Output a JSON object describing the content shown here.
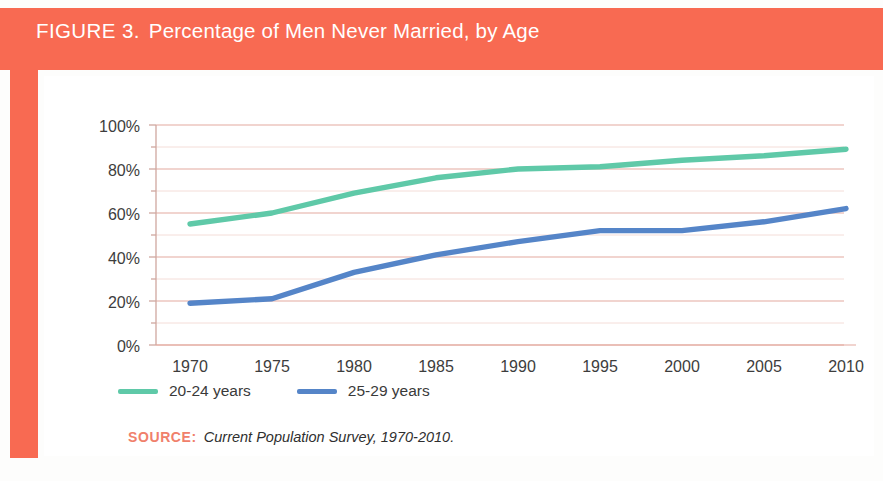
{
  "header": {
    "figure_label": "FIGURE 3.",
    "caption": "Percentage of Men Never Married, by Age",
    "band_color": "#f86a52"
  },
  "source": {
    "key": "SOURCE:",
    "text": "Current Population Survey, 1970-2010.",
    "key_color": "#f0806b"
  },
  "legend": {
    "position": "below-plot",
    "items": [
      {
        "label": "20-24 years",
        "color": "#5fc9a8"
      },
      {
        "label": "25-29 years",
        "color": "#5585c8"
      }
    ]
  },
  "axes": {
    "y_ticks": [
      "0%",
      "20%",
      "40%",
      "60%",
      "80%",
      "100%"
    ],
    "x_ticks": [
      "1970",
      "1975",
      "1980",
      "1985",
      "1990",
      "1995",
      "2000",
      "2005",
      "2010"
    ],
    "gridline_color": "#e9b7ae",
    "minor_gridline_color": "#f3d9d4"
  },
  "chart_data": {
    "type": "line",
    "title": "Percentage of Men Never Married, by Age",
    "xlabel": "",
    "ylabel": "",
    "x": [
      1970,
      1975,
      1980,
      1985,
      1990,
      1995,
      2000,
      2005,
      2010
    ],
    "xlim": [
      1968,
      2012
    ],
    "ylim": [
      0,
      100
    ],
    "y_tick_values": [
      0,
      20,
      40,
      60,
      80,
      100
    ],
    "y_minor_tick_values": [
      10,
      30,
      50,
      70,
      90
    ],
    "grid": true,
    "legend_position": "below",
    "series": [
      {
        "name": "20-24 years",
        "color": "#5fc9a8",
        "values": [
          55,
          60,
          69,
          76,
          80,
          81,
          84,
          86,
          89
        ]
      },
      {
        "name": "25-29 years",
        "color": "#5585c8",
        "values": [
          19,
          21,
          33,
          41,
          47,
          52,
          52,
          56,
          62
        ]
      }
    ],
    "units": "percent",
    "source": "Current Population Survey, 1970-2010."
  }
}
